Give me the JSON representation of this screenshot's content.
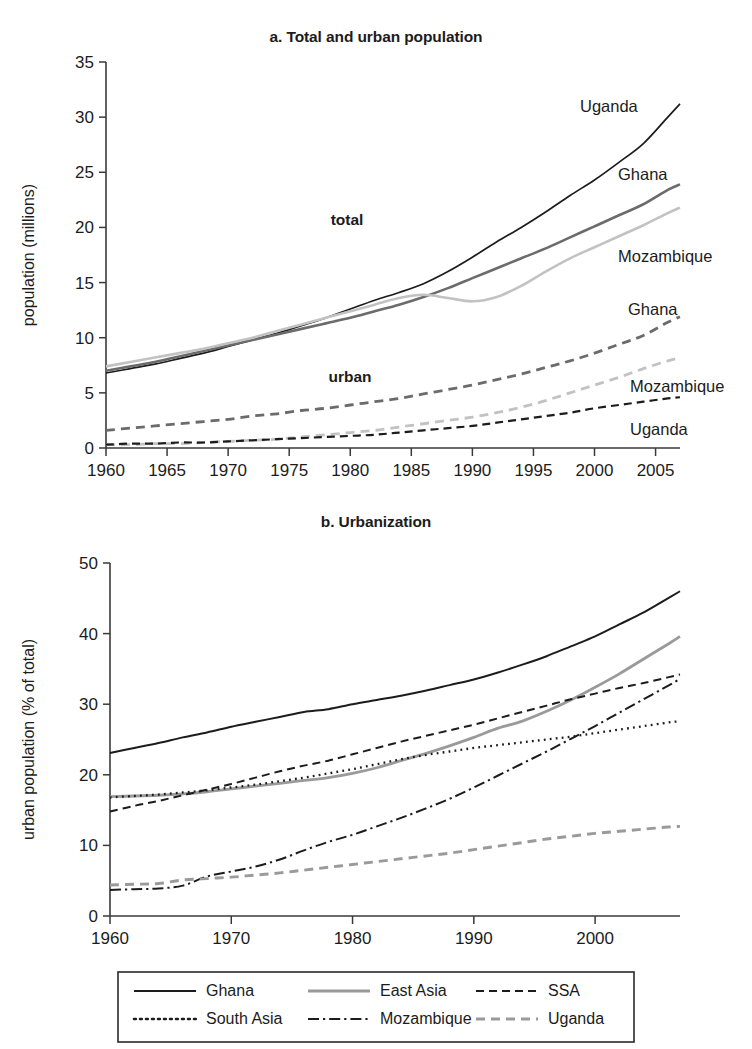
{
  "page": {
    "width": 752,
    "height": 1049,
    "background": "#ffffff"
  },
  "colors": {
    "black": "#1c1c1c",
    "dark_gray": "#6b6b6b",
    "mid_gray": "#8c8c8c",
    "light_gray": "#c2c2c2",
    "axis": "#3a3a3a"
  },
  "panel_a": {
    "title": "a. Total and urban population",
    "ylabel": "population (millions)",
    "xticks": [
      "1960",
      "1965",
      "1970",
      "1975",
      "1980",
      "1985",
      "1990",
      "1995",
      "2000",
      "2005"
    ],
    "yticks": [
      "0",
      "5",
      "10",
      "15",
      "20",
      "25",
      "30",
      "35"
    ],
    "group_labels": {
      "total": "total",
      "urban": "urban"
    },
    "series_labels": [
      {
        "name": "uganda-total-label",
        "text": "Uganda"
      },
      {
        "name": "ghana-total-label",
        "text": "Ghana"
      },
      {
        "name": "mozambique-total-label",
        "text": "Mozambique"
      },
      {
        "name": "ghana-urban-label",
        "text": "Ghana"
      },
      {
        "name": "mozambique-urban-label",
        "text": "Mozambique"
      },
      {
        "name": "uganda-urban-label",
        "text": "Uganda"
      }
    ]
  },
  "panel_b": {
    "title": "b. Urbanization",
    "ylabel": "urban population (% of total)",
    "xticks": [
      "1960",
      "1970",
      "1980",
      "1990",
      "2000"
    ],
    "yticks": [
      "0",
      "10",
      "20",
      "30",
      "40",
      "50"
    ]
  },
  "legend": {
    "items": [
      {
        "label": "Ghana",
        "style": "solid",
        "color": "#1c1c1c"
      },
      {
        "label": "East Asia",
        "style": "solid",
        "color": "#9a9a9a"
      },
      {
        "label": "SSA",
        "style": "dashed",
        "color": "#1c1c1c"
      },
      {
        "label": "South Asia",
        "style": "dotted",
        "color": "#1c1c1c"
      },
      {
        "label": "Mozambique",
        "style": "dashdot",
        "color": "#1c1c1c"
      },
      {
        "label": "Uganda",
        "style": "dashed",
        "color": "#9a9a9a"
      }
    ]
  },
  "chart_data": [
    {
      "type": "line",
      "id": "panel-a",
      "title": "a. Total and urban population",
      "xlabel": "",
      "ylabel": "population (millions)",
      "xlim": [
        1960,
        2007
      ],
      "ylim": [
        0,
        35
      ],
      "ytick_step": 5,
      "xtick_step": 5,
      "grid": false,
      "legend_position": "inline-right-labels",
      "annotations": [
        "total",
        "urban"
      ],
      "x": [
        1960,
        1962,
        1964,
        1966,
        1968,
        1970,
        1972,
        1974,
        1976,
        1978,
        1980,
        1982,
        1984,
        1986,
        1988,
        1990,
        1992,
        1994,
        1996,
        1998,
        2000,
        2002,
        2004,
        2006,
        2007
      ],
      "series": [
        {
          "name": "Uganda total",
          "style": "solid",
          "color": "#1c1c1c",
          "values": [
            6.8,
            7.2,
            7.6,
            8.1,
            8.6,
            9.2,
            9.8,
            10.4,
            11.1,
            11.8,
            12.6,
            13.4,
            14.1,
            14.9,
            16.0,
            17.3,
            18.7,
            20.0,
            21.4,
            22.9,
            24.3,
            25.9,
            27.6,
            30.0,
            31.2
          ]
        },
        {
          "name": "Ghana total",
          "style": "solid",
          "color": "#6b6b6b",
          "values": [
            7.0,
            7.4,
            7.8,
            8.3,
            8.8,
            9.3,
            9.8,
            10.3,
            10.8,
            11.3,
            11.8,
            12.4,
            13.0,
            13.7,
            14.5,
            15.4,
            16.3,
            17.2,
            18.1,
            19.1,
            20.1,
            21.1,
            22.1,
            23.4,
            23.9
          ]
        },
        {
          "name": "Mozambique total",
          "style": "solid",
          "color": "#c2c2c2",
          "values": [
            7.4,
            7.8,
            8.2,
            8.6,
            9.0,
            9.5,
            10.0,
            10.6,
            11.2,
            11.8,
            12.4,
            13.0,
            13.6,
            13.9,
            13.6,
            13.3,
            13.7,
            14.7,
            16.0,
            17.2,
            18.2,
            19.2,
            20.2,
            21.3,
            21.8
          ]
        },
        {
          "name": "Ghana urban",
          "style": "dashed",
          "color": "#6b6b6b",
          "values": [
            1.6,
            1.8,
            2.0,
            2.2,
            2.4,
            2.6,
            2.9,
            3.1,
            3.4,
            3.6,
            3.9,
            4.2,
            4.5,
            4.9,
            5.3,
            5.7,
            6.2,
            6.7,
            7.3,
            7.9,
            8.6,
            9.4,
            10.2,
            11.4,
            11.9
          ]
        },
        {
          "name": "Mozambique urban",
          "style": "dashed",
          "color": "#c2c2c2",
          "values": [
            0.3,
            0.3,
            0.4,
            0.4,
            0.5,
            0.6,
            0.7,
            0.8,
            1.0,
            1.2,
            1.4,
            1.6,
            1.9,
            2.2,
            2.5,
            2.8,
            3.2,
            3.7,
            4.3,
            5.0,
            5.7,
            6.4,
            7.2,
            7.9,
            8.2
          ]
        },
        {
          "name": "Uganda urban",
          "style": "dashed",
          "color": "#1c1c1c",
          "values": [
            0.3,
            0.4,
            0.4,
            0.5,
            0.5,
            0.6,
            0.7,
            0.8,
            0.9,
            1.0,
            1.1,
            1.2,
            1.4,
            1.6,
            1.8,
            2.0,
            2.3,
            2.6,
            2.9,
            3.2,
            3.6,
            3.9,
            4.2,
            4.5,
            4.6
          ]
        }
      ]
    },
    {
      "type": "line",
      "id": "panel-b",
      "title": "b. Urbanization",
      "xlabel": "",
      "ylabel": "urban population (% of total)",
      "xlim": [
        1960,
        2007
      ],
      "ylim": [
        0,
        50
      ],
      "ytick_step": 10,
      "xtick_step": 10,
      "grid": false,
      "legend_position": "bottom",
      "x": [
        1960,
        1962,
        1964,
        1966,
        1968,
        1970,
        1972,
        1974,
        1976,
        1978,
        1980,
        1982,
        1984,
        1986,
        1988,
        1990,
        1992,
        1994,
        1996,
        1998,
        2000,
        2002,
        2004,
        2006,
        2007
      ],
      "series": [
        {
          "name": "Ghana",
          "style": "solid",
          "color": "#1c1c1c",
          "values": [
            23.1,
            23.8,
            24.5,
            25.3,
            26.0,
            26.8,
            27.5,
            28.2,
            28.9,
            29.3,
            30.0,
            30.6,
            31.2,
            31.9,
            32.7,
            33.5,
            34.5,
            35.6,
            36.8,
            38.2,
            39.6,
            41.3,
            43.0,
            45.0,
            46.0
          ]
        },
        {
          "name": "East Asia",
          "style": "solid",
          "color": "#9a9a9a",
          "values": [
            16.9,
            17.0,
            17.1,
            17.3,
            17.6,
            18.0,
            18.4,
            18.8,
            19.2,
            19.6,
            20.2,
            21.0,
            22.0,
            23.0,
            24.1,
            25.3,
            26.6,
            27.6,
            29.0,
            30.6,
            32.4,
            34.3,
            36.4,
            38.5,
            39.6
          ]
        },
        {
          "name": "SSA",
          "style": "dashed",
          "color": "#1c1c1c",
          "values": [
            14.8,
            15.6,
            16.3,
            17.1,
            17.9,
            18.7,
            19.6,
            20.5,
            21.3,
            22.0,
            22.9,
            23.8,
            24.7,
            25.5,
            26.3,
            27.1,
            28.0,
            28.9,
            29.8,
            30.7,
            31.5,
            32.3,
            33.0,
            33.8,
            34.2
          ]
        },
        {
          "name": "South Asia",
          "style": "dotted",
          "color": "#1c1c1c",
          "values": [
            16.8,
            17.0,
            17.2,
            17.5,
            17.8,
            18.2,
            18.6,
            19.1,
            19.6,
            20.2,
            20.8,
            21.5,
            22.2,
            22.8,
            23.3,
            23.8,
            24.2,
            24.6,
            25.0,
            25.4,
            25.9,
            26.4,
            26.9,
            27.4,
            27.6
          ]
        },
        {
          "name": "Mozambique",
          "style": "dashdot",
          "color": "#1c1c1c",
          "values": [
            3.7,
            3.8,
            3.9,
            4.3,
            5.6,
            6.3,
            7.0,
            8.0,
            9.3,
            10.5,
            11.5,
            12.7,
            13.9,
            15.2,
            16.6,
            18.2,
            19.9,
            21.6,
            23.3,
            25.1,
            26.9,
            28.8,
            30.7,
            32.6,
            33.6
          ]
        },
        {
          "name": "Uganda",
          "style": "dashed",
          "color": "#9a9a9a",
          "values": [
            4.4,
            4.5,
            4.6,
            5.1,
            5.3,
            5.5,
            5.8,
            6.1,
            6.5,
            6.9,
            7.3,
            7.7,
            8.1,
            8.5,
            8.9,
            9.4,
            9.9,
            10.4,
            10.9,
            11.3,
            11.7,
            12.0,
            12.3,
            12.6,
            12.7
          ]
        }
      ]
    }
  ]
}
